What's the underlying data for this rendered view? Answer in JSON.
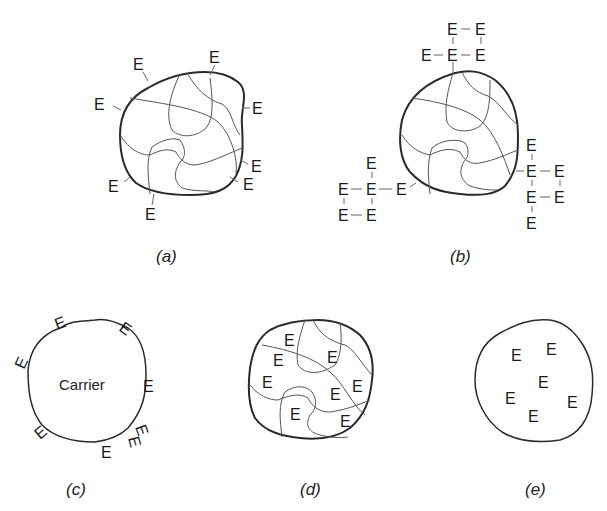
{
  "figure": {
    "panels": [
      {
        "id": "a",
        "caption": "(a)",
        "description": "Enzyme attached by covalent bonds to surface of cross-linked carrier",
        "enzyme_label": "E",
        "enzyme_count": 8
      },
      {
        "id": "b",
        "caption": "(b)",
        "description": "Cross-linked enzyme aggregates bonded to cross-linked carrier surface",
        "enzyme_label": "E",
        "enzyme_count": 18
      },
      {
        "id": "c",
        "caption": "(c)",
        "description": "Enzyme adsorbed on carrier surface",
        "carrier_label": "Carrier",
        "enzyme_label": "E",
        "enzyme_count": 8
      },
      {
        "id": "d",
        "caption": "(d)",
        "description": "Enzyme entrapped within cross-linked polymer network",
        "enzyme_label": "E",
        "enzyme_count": 8
      },
      {
        "id": "e",
        "caption": "(e)",
        "description": "Enzyme encapsulated within membrane",
        "enzyme_label": "E",
        "enzyme_count": 6
      }
    ]
  }
}
